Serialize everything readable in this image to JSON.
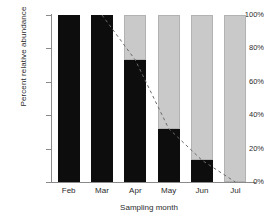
{
  "chart_data": {
    "type": "bar",
    "title": "",
    "xlabel": "Sampling month",
    "ylabel": "Percent relative abundance",
    "categories": [
      "Feb",
      "Mar",
      "Apr",
      "May",
      "Jun",
      "Jul"
    ],
    "ylim": [
      0,
      100
    ],
    "ytick_labels": [
      "0%",
      "20%",
      "40%",
      "60%",
      "80%",
      "100%"
    ],
    "ytick_values": [
      0,
      20,
      40,
      60,
      80,
      100
    ],
    "grid": false,
    "legend": "none",
    "stacked": true,
    "series": [
      {
        "name": "black-segment",
        "color": "#0d0d0d",
        "values": [
          100,
          100,
          73,
          32,
          13,
          0
        ]
      },
      {
        "name": "gray-segment",
        "color": "#c9c9c9",
        "values": [
          0,
          0,
          27,
          68,
          87,
          100
        ]
      }
    ],
    "annotations": [
      {
        "name": "dashed-trend-line",
        "style": "dashed",
        "color": "#6b6b6b",
        "x": [
          "Mar",
          "Apr",
          "May",
          "Jun",
          "Jul"
        ],
        "y": [
          100,
          73,
          32,
          13,
          0
        ]
      }
    ]
  }
}
